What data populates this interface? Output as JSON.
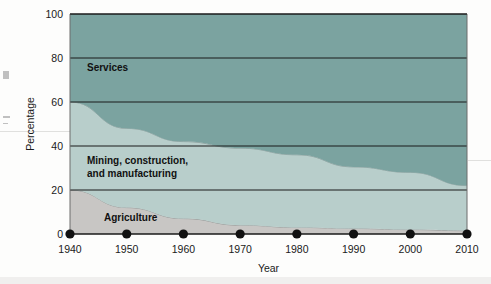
{
  "chart_data": {
    "type": "area",
    "stacked": true,
    "title": "",
    "xlabel": "Year",
    "ylabel": "Percentage",
    "grid": true,
    "legend_position": "inline-labels",
    "x": [
      1940,
      1950,
      1960,
      1970,
      1980,
      1990,
      2000,
      2010
    ],
    "xlim": [
      1940,
      2010
    ],
    "ylim": [
      0,
      100
    ],
    "xticks": [
      "1940",
      "1950",
      "1960",
      "1970",
      "1980",
      "1990",
      "2000",
      "2010"
    ],
    "yticks": [
      "0",
      "20",
      "40",
      "60",
      "80",
      "100"
    ],
    "series": [
      {
        "name": "Agriculture",
        "color": "#c8c6c4",
        "values": [
          20,
          12,
          7,
          4,
          3,
          2.5,
          2,
          1.5
        ]
      },
      {
        "name": "Mining, construction, and manufacturing",
        "color": "#b8cecb",
        "values": [
          40,
          36,
          35,
          35,
          33,
          28,
          26,
          20.5
        ]
      },
      {
        "name": "Services",
        "color": "#7ba3a0",
        "values": [
          40,
          52,
          58,
          61,
          64,
          69.5,
          72,
          78
        ]
      }
    ],
    "band_labels": [
      {
        "text": "Services",
        "x": 1943,
        "y": 74
      },
      {
        "text": "Mining, construction,",
        "x": 1943,
        "y": 32
      },
      {
        "text": "and manufacturing",
        "x": 1943,
        "y": 26
      },
      {
        "text": "Agriculture",
        "x": 1946,
        "y": 6
      }
    ],
    "marker_color": "#111111",
    "gridline_color": "#1a1a1a",
    "axis_color": "#6d6d6d"
  }
}
